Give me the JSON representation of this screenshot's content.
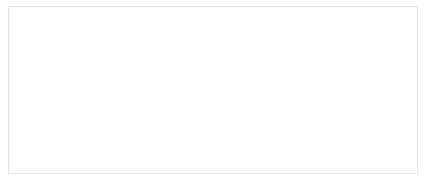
{
  "chart_data": {
    "type": "scatter",
    "title": "",
    "xlabel": "Event Rate (Events/sec)",
    "ylabel": "Mean Latency (sec)",
    "xlim": [
      0,
      16000
    ],
    "ylim": [
      0,
      0.7
    ],
    "xticks": [
      0,
      2000,
      4000,
      6000,
      8000,
      10000,
      12000,
      14000,
      16000
    ],
    "xtick_labels": [
      "0",
      "2000",
      "4000",
      "6000",
      "8000",
      "10000",
      "12000",
      "14000",
      "16000"
    ],
    "yticks": [
      0,
      0.1,
      0.2,
      0.3,
      0.4,
      0.5,
      0.6,
      0.7
    ],
    "ytick_labels": [
      "0",
      "0.1",
      "0.2",
      "0.3",
      "0.4",
      "0.5",
      "0.6",
      "0.7"
    ],
    "grid": "horizontal",
    "legend": "none",
    "series_color": "#8c8c8c",
    "background": "#ffffff",
    "series": [
      {
        "name": "Mean Latency",
        "marker": "circle",
        "line": true,
        "x": [
          60,
          160,
          260,
          360,
          460,
          560,
          660,
          760,
          860,
          960,
          1060,
          1160,
          1260,
          1360,
          1460,
          1560,
          1660,
          1760,
          1860,
          1960,
          2060,
          2160,
          2260,
          2360,
          2460,
          2560,
          2660,
          2760,
          2860,
          2960,
          3060,
          3160,
          3260,
          3360,
          3460,
          3560,
          3660,
          3760,
          3860,
          3960,
          4060,
          4160,
          4260,
          4360,
          4460,
          4560,
          4660,
          4760,
          4860,
          4960,
          5060,
          5160,
          5260,
          5360,
          5460,
          5560,
          5660,
          5760,
          5860,
          5960,
          6060,
          6160,
          6260,
          6360,
          6460,
          6560,
          6660,
          6760,
          6860,
          6960,
          7060,
          7160,
          7260,
          7360,
          7460,
          7560,
          7660,
          7760,
          7860,
          7960,
          8060,
          8160,
          8260,
          8360,
          8460,
          8560,
          8660,
          8760,
          8860,
          8960,
          9060,
          9160,
          9260,
          9360,
          9460,
          9560,
          9660,
          9760,
          9860,
          9960,
          10060,
          10160,
          10260,
          10360,
          10460,
          10560,
          10660,
          10760,
          10860,
          10960,
          11060,
          11160,
          11260,
          11360,
          11460,
          11560,
          11660,
          11760,
          11860,
          11960,
          12060,
          12160,
          12260,
          12360,
          12460,
          12560,
          12660,
          12760,
          12860,
          12960,
          13060,
          13160,
          13260,
          13360,
          13460,
          13560,
          13660,
          13760,
          13860,
          13960,
          14060,
          14160,
          14260,
          14360,
          14460,
          14560,
          14660,
          14760,
          14860,
          14960
        ],
        "y": [
          0.005,
          0.021,
          0.024,
          0.023,
          0.025,
          0.024,
          0.023,
          0.025,
          0.024,
          0.023,
          0.025,
          0.024,
          0.026,
          0.024,
          0.025,
          0.023,
          0.026,
          0.024,
          0.025,
          0.026,
          0.024,
          0.026,
          0.025,
          0.027,
          0.025,
          0.026,
          0.024,
          0.027,
          0.025,
          0.026,
          0.027,
          0.025,
          0.027,
          0.026,
          0.028,
          0.026,
          0.027,
          0.025,
          0.028,
          0.026,
          0.028,
          0.027,
          0.029,
          0.027,
          0.028,
          0.026,
          0.029,
          0.027,
          0.03,
          0.028,
          0.029,
          0.031,
          0.028,
          0.032,
          0.029,
          0.031,
          0.03,
          0.033,
          0.03,
          0.034,
          0.031,
          0.036,
          0.032,
          0.038,
          0.033,
          0.04,
          0.034,
          0.042,
          0.036,
          0.044,
          0.038,
          0.047,
          0.04,
          0.05,
          0.043,
          0.055,
          0.046,
          0.06,
          0.052,
          0.068,
          0.06,
          0.08,
          0.072,
          0.1,
          0.09,
          0.125,
          0.105,
          0.15,
          0.135,
          0.175,
          0.16,
          0.185,
          0.17,
          0.205,
          0.19,
          0.225,
          0.205,
          0.245,
          0.225,
          0.265,
          0.245,
          0.285,
          0.265,
          0.3,
          0.28,
          0.32,
          0.295,
          0.335,
          0.31,
          0.35,
          0.33,
          0.37,
          0.345,
          0.39,
          0.36,
          0.42,
          0.38,
          0.44,
          0.4,
          0.58,
          0.41,
          0.455,
          0.42,
          0.47,
          0.43,
          0.475,
          0.44,
          0.48,
          0.45,
          0.485,
          0.455,
          0.49,
          0.46,
          0.495,
          0.47,
          0.5,
          0.475,
          0.505,
          0.48,
          0.51,
          0.425,
          0.5,
          0.49,
          0.52,
          0.495,
          0.53,
          0.505,
          0.615,
          0.52,
          0.555
        ]
      }
    ]
  }
}
